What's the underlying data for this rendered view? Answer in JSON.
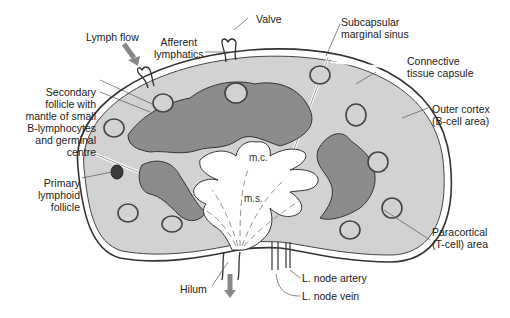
{
  "colors": {
    "background": "#ffffff",
    "cortex": "#d2d2d2",
    "paracortex": "#8c8c8c",
    "medulla": "#ffffff",
    "outline": "#333333",
    "primary_follicle": "#4a4a4a",
    "arrow": "#8a8a8a"
  },
  "labels": {
    "lymph_flow": "Lymph flow",
    "afferent_lymphatics": [
      "Afferent",
      "lymphatics"
    ],
    "valve": "Valve",
    "subcapsular_sinus": [
      "Subcapsular",
      "marginal sinus"
    ],
    "connective_capsule": [
      "Connective",
      "tissue capsule"
    ],
    "outer_cortex": [
      "Outer cortex",
      "(B-cell area)"
    ],
    "secondary_follicle": [
      "Secondary",
      "follicle with",
      "mantle of small",
      "B-lymphocytes",
      "and germinal",
      "centre"
    ],
    "primary_follicle": [
      "Primary",
      "lymphoid",
      "follicle"
    ],
    "paracortical": [
      "Paracortical",
      "(T-cell) area"
    ],
    "medullary_cords": "m.c.",
    "medullary_sinus": "m.s.",
    "hilum": "Hilum",
    "artery": "L. node artery",
    "vein": "L. node vein"
  }
}
